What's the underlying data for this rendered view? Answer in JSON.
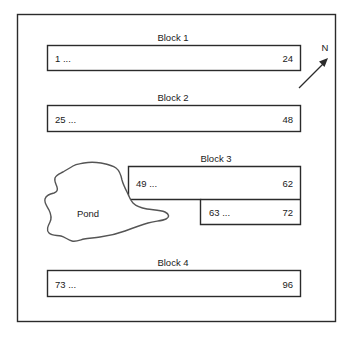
{
  "diagram": {
    "title_visible": false,
    "border": {
      "name": "field-boundary"
    },
    "north_indicator": {
      "label": "N",
      "arrow_direction": "northeast"
    },
    "pond": {
      "label": "Pond"
    },
    "blocks": [
      {
        "label": "Block 1",
        "shape": "rectangle",
        "cells": [
          {
            "start_label": "1 ...",
            "end_label": "24"
          }
        ]
      },
      {
        "label": "Block 2",
        "shape": "rectangle",
        "cells": [
          {
            "start_label": "25 ...",
            "end_label": "48"
          }
        ]
      },
      {
        "label": "Block 3",
        "shape": "l-shape",
        "cells": [
          {
            "start_label": "49 ...",
            "end_label": "62"
          },
          {
            "start_label": "63 ...",
            "end_label": "72"
          }
        ]
      },
      {
        "label": "Block 4",
        "shape": "rectangle",
        "cells": [
          {
            "start_label": "73 ...",
            "end_label": "96"
          }
        ]
      }
    ]
  },
  "colors": {
    "stroke": "#2b2b2b",
    "pond_stroke": "#555555",
    "background": "#ffffff",
    "text": "#1a1a1a"
  }
}
